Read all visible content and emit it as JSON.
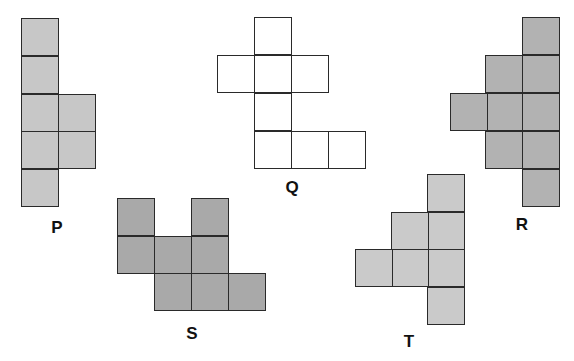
{
  "figure": {
    "cell_size": 37,
    "line_color": "#2a2a2a",
    "shapes": [
      {
        "id": "P",
        "label": "P",
        "fill": "#c7c7c7",
        "label_pos": [
          57,
          227
        ],
        "cells": [
          [
            21,
            18
          ],
          [
            21,
            56
          ],
          [
            21,
            94
          ],
          [
            58,
            94
          ],
          [
            21,
            131
          ],
          [
            58,
            131
          ],
          [
            21,
            169
          ]
        ]
      },
      {
        "id": "Q",
        "label": "Q",
        "fill": "#ffffff",
        "label_pos": [
          292,
          187
        ],
        "cells": [
          [
            254,
            17
          ],
          [
            217,
            55
          ],
          [
            254,
            55
          ],
          [
            291,
            55
          ],
          [
            254,
            93
          ],
          [
            254,
            131
          ],
          [
            291,
            131
          ],
          [
            328,
            131
          ]
        ]
      },
      {
        "id": "R",
        "label": "R",
        "fill": "#b2b2b2",
        "label_pos": [
          522,
          224
        ],
        "cells": [
          [
            522,
            17
          ],
          [
            485,
            55
          ],
          [
            522,
            55
          ],
          [
            450,
            93
          ],
          [
            485,
            93
          ],
          [
            522,
            93
          ],
          [
            485,
            131
          ],
          [
            522,
            131
          ],
          [
            522,
            169
          ]
        ]
      },
      {
        "id": "S",
        "label": "S",
        "fill": "#a9a9a9",
        "label_pos": [
          192,
          333
        ],
        "cells": [
          [
            117,
            198
          ],
          [
            191,
            198
          ],
          [
            117,
            236
          ],
          [
            154,
            236
          ],
          [
            191,
            236
          ],
          [
            154,
            273
          ],
          [
            191,
            273
          ],
          [
            228,
            273
          ]
        ]
      },
      {
        "id": "T",
        "label": "T",
        "fill": "#cacaca",
        "label_pos": [
          409,
          341
        ],
        "cells": [
          [
            427,
            174
          ],
          [
            391,
            212
          ],
          [
            427,
            212
          ],
          [
            355,
            249
          ],
          [
            391,
            249
          ],
          [
            427,
            249
          ],
          [
            427,
            287
          ]
        ]
      }
    ]
  }
}
